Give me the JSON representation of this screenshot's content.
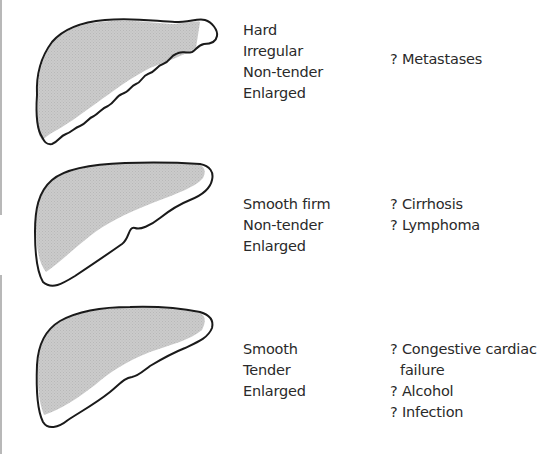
{
  "diagram": {
    "colors": {
      "liver_fill": "#c8c8c8",
      "outline": "#1a1a1a",
      "text": "#2a2a2a"
    },
    "rows": [
      {
        "shape": "liver-irregular-nodular-edge",
        "features": [
          "Hard",
          "Irregular",
          "Non-tender",
          "Enlarged"
        ],
        "diagnoses": [
          "? Metastases"
        ]
      },
      {
        "shape": "liver-smooth-firm",
        "features": [
          "Smooth firm",
          "Non-tender",
          "Enlarged"
        ],
        "diagnoses": [
          "? Cirrhosis",
          "? Lymphoma"
        ]
      },
      {
        "shape": "liver-smooth-tender",
        "features": [
          "Smooth",
          "Tender",
          "Enlarged"
        ],
        "diagnoses": [
          "? Congestive cardiac",
          "failure",
          "? Alcohol",
          "? Infection"
        ]
      }
    ]
  }
}
